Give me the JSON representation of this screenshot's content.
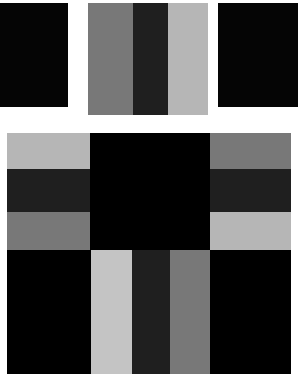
{
  "artwork": {
    "title": "Grayscale Color-Field Composition",
    "canvas": {
      "width": 298,
      "height": 379,
      "background": "#ffffff"
    },
    "palette": {
      "black": "#050505",
      "near_black": "#000000",
      "dark_charcoal": "#1f1f1f",
      "medium_gray": "#787878",
      "light_gray": "#b6b6b6",
      "pale_gray": "#c4c4c4",
      "white": "#ffffff"
    },
    "panels": [
      {
        "id": "top-left-black",
        "name": "top-left-black-panel",
        "x": 0,
        "y": 3,
        "width": 68,
        "height": 104,
        "fill": "#050505",
        "bands": []
      },
      {
        "id": "top-center-striped",
        "name": "top-center-striped-panel",
        "x": 88,
        "y": 3,
        "width": 120,
        "height": 112,
        "fill": "#787878",
        "orientation": "vertical",
        "bands": [
          {
            "name": "band-medium-gray",
            "offset": 0,
            "size": 45,
            "fill": "#787878"
          },
          {
            "name": "band-dark-charcoal",
            "offset": 45,
            "size": 35,
            "fill": "#1f1f1f"
          },
          {
            "name": "band-light-gray",
            "offset": 80,
            "size": 40,
            "fill": "#b6b6b6"
          }
        ]
      },
      {
        "id": "top-right-black",
        "name": "top-right-black-panel",
        "x": 218,
        "y": 3,
        "width": 80,
        "height": 104,
        "fill": "#050505",
        "bands": []
      },
      {
        "id": "mid-left-striped",
        "name": "mid-left-horizontal-striped-panel",
        "x": 7,
        "y": 133,
        "width": 83,
        "height": 117,
        "fill": "#b6b6b6",
        "orientation": "horizontal",
        "bands": [
          {
            "name": "band-light-gray",
            "offset": 0,
            "size": 36,
            "fill": "#b6b6b6"
          },
          {
            "name": "band-dark-charcoal",
            "offset": 36,
            "size": 43,
            "fill": "#1f1f1f"
          },
          {
            "name": "band-medium-gray",
            "offset": 79,
            "size": 38,
            "fill": "#787878"
          }
        ]
      },
      {
        "id": "center-black-square",
        "name": "center-black-square",
        "x": 90,
        "y": 133,
        "width": 120,
        "height": 117,
        "fill": "#000000",
        "bands": []
      },
      {
        "id": "mid-right-striped",
        "name": "mid-right-horizontal-striped-panel",
        "x": 210,
        "y": 133,
        "width": 81,
        "height": 117,
        "fill": "#787878",
        "orientation": "horizontal",
        "bands": [
          {
            "name": "band-medium-gray",
            "offset": 0,
            "size": 36,
            "fill": "#787878"
          },
          {
            "name": "band-dark-charcoal",
            "offset": 36,
            "size": 43,
            "fill": "#1f1f1f"
          },
          {
            "name": "band-light-gray",
            "offset": 79,
            "size": 38,
            "fill": "#b6b6b6"
          }
        ]
      },
      {
        "id": "bottom-left-black",
        "name": "bottom-left-black-panel",
        "x": 7,
        "y": 250,
        "width": 84,
        "height": 124,
        "fill": "#000000",
        "bands": []
      },
      {
        "id": "bottom-center-striped",
        "name": "bottom-center-vertical-striped-panel",
        "x": 91,
        "y": 250,
        "width": 119,
        "height": 124,
        "fill": "#b6b6b6",
        "orientation": "vertical",
        "bands": [
          {
            "name": "band-light-gray",
            "offset": 0,
            "size": 41,
            "fill": "#c4c4c4"
          },
          {
            "name": "band-dark-charcoal",
            "offset": 41,
            "size": 38,
            "fill": "#1f1f1f"
          },
          {
            "name": "band-medium-gray",
            "offset": 79,
            "size": 40,
            "fill": "#787878"
          }
        ]
      },
      {
        "id": "bottom-right-black",
        "name": "bottom-right-black-panel",
        "x": 210,
        "y": 250,
        "width": 81,
        "height": 124,
        "fill": "#000000",
        "bands": []
      }
    ]
  }
}
